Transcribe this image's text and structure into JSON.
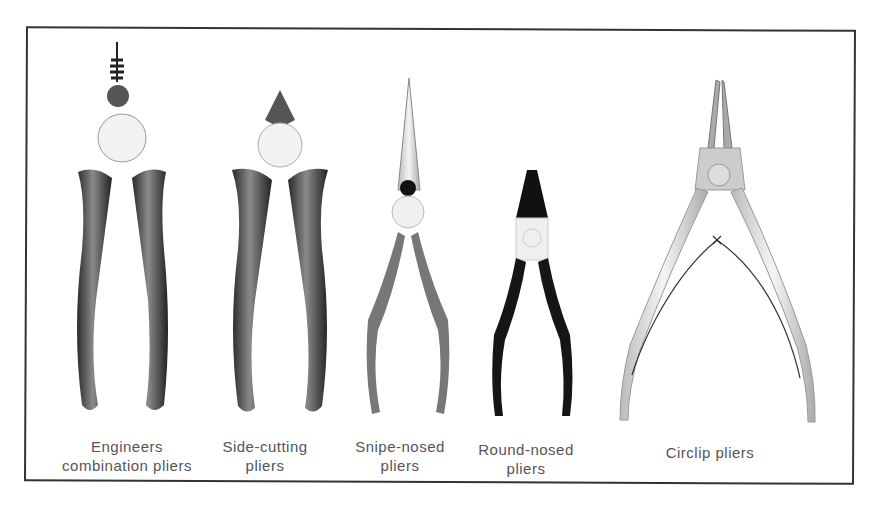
{
  "figure": {
    "items": [
      {
        "id": "engineers",
        "caption_line1": "Engineers",
        "caption_line2": "combination pliers"
      },
      {
        "id": "side-cutting",
        "caption_line1": "Side-cutting",
        "caption_line2": "pliers"
      },
      {
        "id": "snipe-nosed",
        "caption_line1": "Snipe-nosed",
        "caption_line2": "pliers"
      },
      {
        "id": "round-nosed",
        "caption_line1": "Round-nosed",
        "caption_line2": "pliers"
      },
      {
        "id": "circlip",
        "caption_line1": "Circlip pliers",
        "caption_line2": ""
      }
    ],
    "colors": {
      "frame": "#333333",
      "caption": "#555555",
      "handle_dark": "#3a3a3a",
      "handle_mid": "#6e6e6e",
      "handle_black": "#151515",
      "metal": "#e8e8e8"
    }
  }
}
